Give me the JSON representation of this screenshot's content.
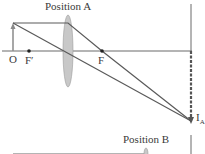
{
  "labels": {
    "position_a": "Position A",
    "position_b": "Position B",
    "object": "O",
    "focal_left": "F′",
    "focal_right": "F",
    "image": "I",
    "image_sub": "A"
  },
  "colors": {
    "line": "#5a5a5a",
    "axis": "#6a6a6a",
    "lens_fill": "#c8c8c8",
    "object_arrow": "#8a8a8a",
    "text": "#3a3a3a"
  }
}
